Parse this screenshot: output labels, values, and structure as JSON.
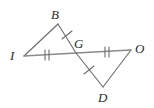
{
  "figure": {
    "background_color": "#ffffff",
    "stroke_color": "#6b6b6b",
    "label_color": "#2b2b2b",
    "width": 154,
    "height": 108
  },
  "labels": {
    "b": "B",
    "i": "I",
    "g": "G",
    "o": "O",
    "d": "D"
  },
  "points": {
    "B": {
      "x": 58,
      "y": 24
    },
    "I": {
      "x": 24,
      "y": 56
    },
    "G": {
      "x": 76,
      "y": 53
    },
    "O": {
      "x": 131,
      "y": 50
    },
    "D": {
      "x": 103,
      "y": 87
    }
  },
  "segments": [
    {
      "name": "IB",
      "from": "I",
      "to": "B",
      "ticks": 0
    },
    {
      "name": "BG",
      "from": "B",
      "to": "G",
      "ticks": 1
    },
    {
      "name": "IG",
      "from": "I",
      "to": "G",
      "ticks": 2
    },
    {
      "name": "GO",
      "from": "G",
      "to": "O",
      "ticks": 2
    },
    {
      "name": "GD",
      "from": "G",
      "to": "D",
      "ticks": 1
    },
    {
      "name": "DO",
      "from": "D",
      "to": "O",
      "ticks": 0
    }
  ],
  "label_positions": {
    "B": {
      "x": 51,
      "y": 8
    },
    "I": {
      "x": 10,
      "y": 49
    },
    "G": {
      "x": 74,
      "y": 37
    },
    "O": {
      "x": 135,
      "y": 42
    },
    "D": {
      "x": 98,
      "y": 91
    }
  }
}
